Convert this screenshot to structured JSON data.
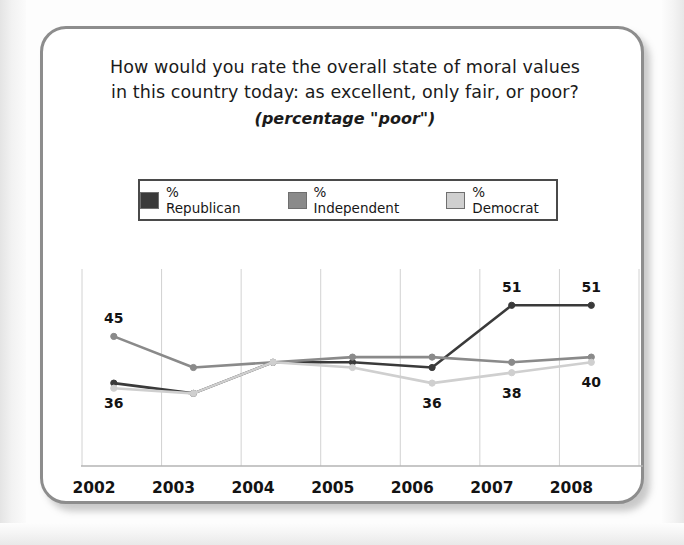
{
  "card": {
    "title_line_1": "How would you rate the overall state of moral values",
    "title_line_2": "in this country today: as excellent, only fair, or poor?",
    "subtitle": "(percentage \"poor\")"
  },
  "legend": {
    "items": [
      {
        "label": "% Republican",
        "color": "#3a3a3a"
      },
      {
        "label": "% Independent",
        "color": "#8a8a8a"
      },
      {
        "label": "% Democrat",
        "color": "#cfcfcf"
      }
    ]
  },
  "colors": {
    "republican": "#3a3a3a",
    "independent": "#8a8a8a",
    "democrat": "#cfcfcf",
    "gridline": "#d2d2d2",
    "axis": "#b4b4b4",
    "text": "#131313",
    "card_border": "#8d8d8d"
  },
  "chart_data": {
    "type": "line",
    "title": "How would you rate the overall state of moral values in this country today: as excellent, only fair, or poor?",
    "subtitle": "(percentage \"poor\")",
    "xlabel": "",
    "ylabel": "",
    "ylim": [
      20,
      58
    ],
    "grid": true,
    "legend_position": "top",
    "categories": [
      "2002",
      "2003",
      "2004",
      "2005",
      "2006",
      "2007",
      "2008"
    ],
    "series": [
      {
        "name": "% Republican",
        "color": "#3a3a3a",
        "values": [
          36,
          34,
          40,
          40,
          39,
          51,
          51
        ],
        "labels": [
          {
            "index": 0,
            "text": "36",
            "position": "below"
          },
          {
            "index": 5,
            "text": "51",
            "position": "above"
          },
          {
            "index": 6,
            "text": "51",
            "position": "above"
          }
        ]
      },
      {
        "name": "% Independent",
        "color": "#8a8a8a",
        "values": [
          45,
          39,
          40,
          41,
          41,
          40,
          41
        ],
        "labels": [
          {
            "index": 0,
            "text": "45",
            "position": "above"
          }
        ]
      },
      {
        "name": "% Democrat",
        "color": "#cfcfcf",
        "values": [
          35,
          34,
          40,
          39,
          36,
          38,
          40
        ],
        "labels": [
          {
            "index": 4,
            "text": "36",
            "position": "below"
          },
          {
            "index": 5,
            "text": "38",
            "position": "below"
          },
          {
            "index": 6,
            "text": "40",
            "position": "below"
          }
        ]
      }
    ],
    "tick_labels": [
      "2002",
      "2003",
      "2004",
      "2005",
      "2006",
      "2007",
      "2008"
    ]
  }
}
